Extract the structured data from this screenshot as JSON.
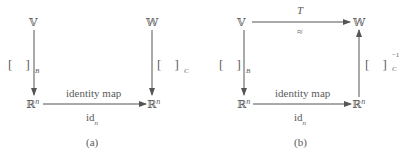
{
  "diagram_a": {
    "caption": "(a)",
    "top_left": "𝕍",
    "top_right": "𝕎",
    "bottom_left": "ℝ",
    "bottom_right": "ℝ",
    "exponent": "n",
    "left_map": {
      "bracket": "[  ]",
      "subscript": "B"
    },
    "right_map": {
      "bracket": "[  ]",
      "subscript": "C"
    },
    "bottom_map_above": "identity map",
    "bottom_map_below_base": "id",
    "bottom_map_below_sub": "n"
  },
  "diagram_b": {
    "caption": "(b)",
    "top_left": "𝕍",
    "top_right": "𝕎",
    "bottom_left": "ℝ",
    "bottom_right": "ℝ",
    "exponent": "n",
    "top_map_above": "T",
    "top_map_below": "≈",
    "left_map": {
      "bracket": "[  ]",
      "subscript": "B"
    },
    "right_map": {
      "bracket": "[  ]",
      "subscript": "C",
      "superscript": "−1"
    },
    "bottom_map_above": "identity map",
    "bottom_map_below_base": "id",
    "bottom_map_below_sub": "n"
  },
  "colors": {
    "line": "#555555",
    "text": "#5a5a5a"
  }
}
